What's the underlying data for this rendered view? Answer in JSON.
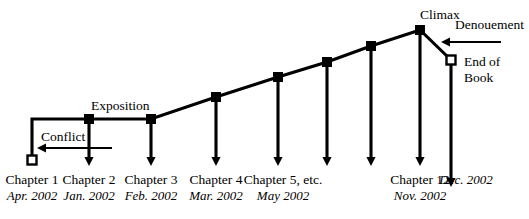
{
  "diagram": {
    "type": "plot-structure-diagram",
    "stroke_color": "#000000",
    "background_color": "#ffffff",
    "width": 529,
    "height": 219
  },
  "stage_labels": [
    {
      "id": "exposition",
      "text": "Exposition",
      "x": 91,
      "y": 99
    },
    {
      "id": "climax",
      "text": "Climax",
      "x": 420,
      "y": 8
    },
    {
      "id": "denouement",
      "text": "Denouement",
      "x": 455,
      "y": 18
    },
    {
      "id": "conflict",
      "text": "Conflict",
      "x": 41,
      "y": 130
    }
  ],
  "end_of_book": {
    "line1": "End of",
    "line2": "Book",
    "x": 464,
    "y": 54
  },
  "markers": {
    "filled_square_label": "plot-point-marker",
    "open_square_label": "endpoint-marker"
  },
  "nodes": [
    {
      "id": "start",
      "type": "open-square",
      "x": 32,
      "y": 160
    },
    {
      "id": "exposition",
      "type": "filled-square",
      "x": 89,
      "y": 119
    },
    {
      "id": "point-3",
      "type": "filled-square",
      "x": 151,
      "y": 119
    },
    {
      "id": "point-4",
      "type": "filled-square",
      "x": 216,
      "y": 97
    },
    {
      "id": "point-5",
      "type": "filled-square",
      "x": 278,
      "y": 77
    },
    {
      "id": "point-6",
      "type": "filled-square",
      "x": 327,
      "y": 62
    },
    {
      "id": "point-7",
      "type": "filled-square",
      "x": 371,
      "y": 46
    },
    {
      "id": "climax",
      "type": "filled-square",
      "x": 420,
      "y": 30
    },
    {
      "id": "end-of-book",
      "type": "open-square",
      "x": 451,
      "y": 60
    }
  ],
  "axis_labels": [
    {
      "chapter": "Chapter 1",
      "date": "Apr. 2002",
      "x": 32,
      "tick": false
    },
    {
      "chapter": "Chapter 2",
      "date": "Jan. 2002",
      "x": 89,
      "tick": true
    },
    {
      "chapter": "Chapter 3",
      "date": "Feb. 2002",
      "x": 151,
      "tick": true
    },
    {
      "chapter": "Chapter 4",
      "date": "Mar. 2002",
      "x": 216,
      "tick": true
    },
    {
      "chapter": "Chapter 5, etc.",
      "date": "May 2002",
      "x": 283,
      "tick": true
    },
    {
      "chapter": "Chapter 12",
      "date": "Nov. 2002",
      "x": 420,
      "tick": true
    },
    {
      "chapter": "",
      "date": "Dec. 2002",
      "x": 466,
      "tick": true
    }
  ],
  "arrows": {
    "conflict": {
      "from_x": 112,
      "to_x": 37,
      "y": 148
    },
    "denouement": {
      "from_x": 501,
      "to_x": 441,
      "y": 42
    }
  }
}
